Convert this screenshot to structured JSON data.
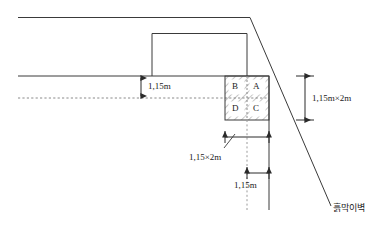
{
  "diagram": {
    "colors": {
      "line": "#3a3a3a",
      "hatch": "#6b6b6b",
      "dashed": "#8a8a8a",
      "text": "#1a1a1a",
      "background": "#ffffff"
    },
    "grid_cells": [
      {
        "id": "B",
        "label": "B",
        "position": "top-left"
      },
      {
        "id": "A",
        "label": "A",
        "position": "top-right"
      },
      {
        "id": "D",
        "label": "D",
        "position": "bottom-left"
      },
      {
        "id": "C",
        "label": "C",
        "position": "bottom-right"
      }
    ],
    "dimensions": [
      {
        "id": "depth-to-dashed",
        "label": "1,15m",
        "orientation": "vertical",
        "side": "left"
      },
      {
        "id": "total-height",
        "label": "1,15m×2m",
        "orientation": "vertical",
        "side": "right"
      },
      {
        "id": "total-width",
        "label": "1,15×2m",
        "orientation": "horizontal",
        "side": "bottom"
      },
      {
        "id": "half-width",
        "label": "1,15m",
        "orientation": "horizontal",
        "side": "bottom"
      }
    ],
    "annotations": [
      {
        "id": "retaining-wall",
        "label": "흙막이벽",
        "target": "diagonal-slope-line"
      }
    ]
  }
}
